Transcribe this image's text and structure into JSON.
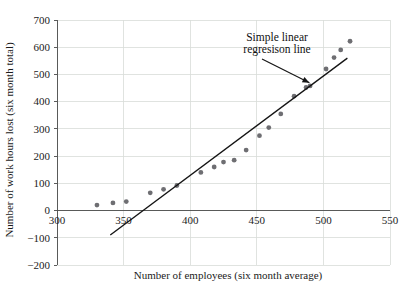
{
  "chart_data": {
    "type": "scatter",
    "title": "",
    "xlabel": "Number of employees (six month average)",
    "ylabel": "Number of work hours lost (six month total)",
    "xlim": [
      300,
      550
    ],
    "ylim": [
      -200,
      700
    ],
    "xticks": [
      300,
      350,
      400,
      450,
      500,
      550
    ],
    "yticks": [
      -200,
      -100,
      0,
      100,
      200,
      300,
      400,
      500,
      600,
      700
    ],
    "grid": true,
    "legend": "none",
    "series": [
      {
        "name": "Observed plants",
        "marker": "filled-circle",
        "color": "#6e6e72",
        "points": [
          [
            330,
            20
          ],
          [
            342,
            28
          ],
          [
            352,
            33
          ],
          [
            370,
            65
          ],
          [
            380,
            78
          ],
          [
            390,
            92
          ],
          [
            408,
            140
          ],
          [
            418,
            160
          ],
          [
            425,
            178
          ],
          [
            433,
            185
          ],
          [
            442,
            222
          ],
          [
            452,
            275
          ],
          [
            459,
            305
          ],
          [
            468,
            355
          ],
          [
            478,
            420
          ],
          [
            487,
            452
          ],
          [
            490,
            458
          ],
          [
            502,
            520
          ],
          [
            508,
            562
          ],
          [
            513,
            590
          ],
          [
            520,
            622
          ]
        ]
      }
    ],
    "regression_line": {
      "label": "Simple linear regresison line",
      "color": "#151515",
      "x_start": 340,
      "y_start": -90,
      "x_end": 518,
      "y_end": 560
    },
    "annotations": [
      {
        "name": "regression-line-callout",
        "line1": "Simple linear",
        "line2": "regresison line",
        "arrow_from": [
          470,
          490
        ],
        "arrow_to": [
          491,
          455
        ]
      }
    ]
  },
  "axes": {
    "x_title": "Number of employees (six month average)",
    "y_title": "Number of work hours lost (six month total)",
    "x_tick_labels": [
      "300",
      "350",
      "400",
      "450",
      "500",
      "550"
    ],
    "y_tick_labels": [
      "700",
      "600",
      "500",
      "400",
      "300",
      "200",
      "100",
      "0",
      "−100",
      "−200"
    ]
  },
  "colors": {
    "marker": "#6e6e72",
    "line": "#151515",
    "grid": "#d8dcd8",
    "axis": "#4a4a4a",
    "background": "#ffffff"
  }
}
